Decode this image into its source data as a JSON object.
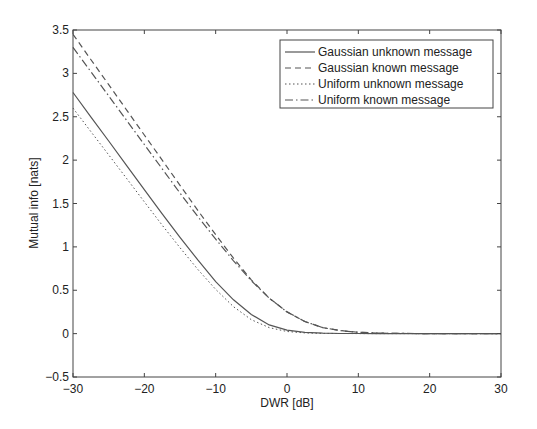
{
  "chart_data": {
    "type": "line",
    "title": "",
    "xlabel": "DWR [dB]",
    "ylabel": "Mutual info [nats]",
    "xlim": [
      -30,
      30
    ],
    "ylim": [
      -0.5,
      3.5
    ],
    "xticks": [
      -30,
      -20,
      -10,
      0,
      10,
      20,
      30
    ],
    "xtick_labels": [
      "−30",
      "−20",
      "−10",
      "0",
      "10",
      "20",
      "30"
    ],
    "yticks": [
      -0.5,
      0,
      0.5,
      1,
      1.5,
      2,
      2.5,
      3,
      3.5
    ],
    "ytick_labels": [
      "−0.5",
      "0",
      "0.5",
      "1",
      "1.5",
      "2",
      "2.5",
      "3",
      "3.5"
    ],
    "grid": false,
    "legend_position": "upper right",
    "x": [
      -30,
      -27.5,
      -25,
      -22.5,
      -20,
      -17.5,
      -15,
      -12.5,
      -10,
      -7.5,
      -5,
      -2.5,
      0,
      2.5,
      5,
      7.5,
      10,
      12.5,
      15,
      20,
      25,
      30
    ],
    "series": [
      {
        "name": "Gaussian unknown message",
        "style": "solid",
        "values": [
          2.78,
          2.5,
          2.22,
          1.94,
          1.66,
          1.38,
          1.11,
          0.85,
          0.6,
          0.39,
          0.22,
          0.1,
          0.04,
          0.015,
          0.005,
          0.002,
          0.001,
          0.0,
          0.0,
          0.0,
          0.0,
          0.0
        ]
      },
      {
        "name": "Gaussian known message",
        "style": "dashed",
        "values": [
          3.45,
          3.16,
          2.87,
          2.58,
          2.29,
          2.0,
          1.71,
          1.42,
          1.14,
          0.87,
          0.62,
          0.41,
          0.25,
          0.14,
          0.07,
          0.035,
          0.015,
          0.007,
          0.003,
          0.0,
          0.0,
          0.0
        ]
      },
      {
        "name": "Uniform unknown message",
        "style": "dotted",
        "values": [
          2.6,
          2.33,
          2.06,
          1.79,
          1.52,
          1.25,
          0.99,
          0.74,
          0.51,
          0.31,
          0.16,
          0.07,
          0.025,
          0.008,
          0.003,
          0.001,
          0.0,
          0.0,
          0.0,
          0.0,
          0.0,
          0.0
        ]
      },
      {
        "name": "Uniform known message",
        "style": "dashdot",
        "values": [
          3.3,
          3.02,
          2.74,
          2.46,
          2.18,
          1.9,
          1.62,
          1.35,
          1.09,
          0.84,
          0.61,
          0.41,
          0.25,
          0.14,
          0.07,
          0.035,
          0.015,
          0.007,
          0.003,
          0.0,
          0.0,
          0.0
        ]
      }
    ]
  },
  "colors": {
    "axis": "#333333",
    "line": "#555555",
    "background": "#ffffff"
  }
}
